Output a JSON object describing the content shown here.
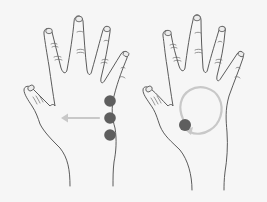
{
  "figure": {
    "panels": [
      {
        "id": "left",
        "description": "Hand (palm facing) with three pressure dots along outer palm edge and an arrow pointing left toward the thumb",
        "dot_count": 3,
        "dot_color": "#5e5e5e",
        "arrow_direction": "left",
        "guide_color": "#c8c8c8"
      },
      {
        "id": "right",
        "description": "Hand (palm facing) with one pressure dot near thumb base and a circular arrow guide in the palm",
        "dot_count": 1,
        "dot_color": "#5e5e5e",
        "guide_shape": "circle-arrow",
        "guide_color": "#c8c8c8"
      }
    ],
    "outline_color": "#4a4a4a",
    "background_color": "#f6f6f6"
  }
}
